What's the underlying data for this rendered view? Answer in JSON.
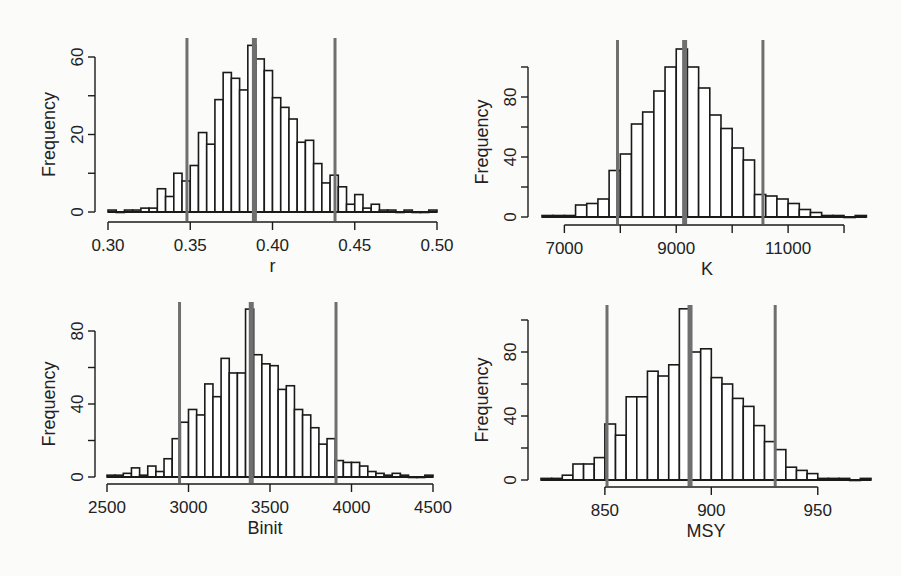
{
  "figure": {
    "background": "#fbfbfa",
    "bar_stroke": "#1a1a1a",
    "bar_fill": "#ffffff",
    "vline_color": "#6f6f6f",
    "axis_color": "#1a1a1a"
  },
  "chart_data": [
    {
      "id": "r",
      "type": "bar",
      "title": "",
      "xlabel": "r",
      "ylabel": "Frequency",
      "xlim": [
        0.3,
        0.5
      ],
      "ylim": [
        0,
        80
      ],
      "xticks": [
        0.3,
        0.35,
        0.4,
        0.45,
        0.5
      ],
      "xtick_labels": [
        "0.30",
        "0.35",
        "0.40",
        "0.45",
        "0.50"
      ],
      "yticks": [
        0,
        20,
        40,
        60,
        80
      ],
      "ytick_labels": [
        "0",
        "",
        "20",
        "",
        "60"
      ],
      "ytick_label_values": [
        0,
        20,
        60
      ],
      "bin_start": 0.3,
      "bin_width": 0.005,
      "values": [
        1,
        0,
        1,
        1,
        2,
        2,
        12,
        8,
        20,
        16,
        24,
        41,
        35,
        58,
        72,
        69,
        63,
        86,
        79,
        73,
        59,
        54,
        48,
        36,
        37,
        25,
        15,
        19,
        13,
        4,
        9,
        2,
        4,
        1,
        1,
        0,
        1,
        0,
        0,
        1
      ],
      "vlines": [
        {
          "x": 0.348,
          "role": "lower"
        },
        {
          "x": 0.389,
          "role": "median"
        },
        {
          "x": 0.438,
          "role": "upper"
        }
      ]
    },
    {
      "id": "K",
      "type": "bar",
      "title": "",
      "xlabel": "K",
      "ylabel": "Frequency",
      "xlim": [
        6600,
        12500
      ],
      "ylim": [
        0,
        100
      ],
      "xticks": [
        7000,
        8000,
        9000,
        10000,
        11000,
        12000
      ],
      "xtick_labels": [
        "7000",
        "",
        "9000",
        "",
        "11000",
        ""
      ],
      "yticks": [
        0,
        20,
        40,
        60,
        80,
        100
      ],
      "ytick_labels": [
        "0",
        "",
        "40",
        "",
        "80",
        ""
      ],
      "bin_start": 6600,
      "bin_width": 200,
      "values": [
        1,
        1,
        1,
        8,
        9,
        12,
        31,
        42,
        62,
        70,
        84,
        100,
        112,
        100,
        86,
        68,
        59,
        46,
        38,
        15,
        14,
        12,
        9,
        5,
        3,
        1,
        1,
        0,
        1
      ],
      "vlines": [
        {
          "x": 7950,
          "role": "lower"
        },
        {
          "x": 9150,
          "role": "median"
        },
        {
          "x": 10550,
          "role": "upper"
        }
      ]
    },
    {
      "id": "Binit",
      "type": "bar",
      "title": "",
      "xlabel": "Binit",
      "ylabel": "Frequency",
      "xlim": [
        2500,
        4500
      ],
      "ylim": [
        0,
        80
      ],
      "xticks": [
        2500,
        3000,
        3500,
        4000,
        4500
      ],
      "xtick_labels": [
        "2500",
        "3000",
        "3500",
        "4000",
        "4500"
      ],
      "yticks": [
        0,
        20,
        40,
        60,
        80
      ],
      "ytick_labels": [
        "0",
        "",
        "40",
        "",
        "80"
      ],
      "bin_start": 2500,
      "bin_width": 50,
      "values": [
        1,
        1,
        2,
        5,
        1,
        6,
        3,
        10,
        21,
        30,
        37,
        34,
        51,
        44,
        65,
        57,
        57,
        92,
        67,
        62,
        61,
        48,
        50,
        37,
        34,
        27,
        18,
        21,
        9,
        8,
        8,
        6,
        3,
        2,
        1,
        2,
        1,
        0,
        0,
        1
      ],
      "vlines": [
        {
          "x": 2945,
          "role": "lower"
        },
        {
          "x": 3385,
          "role": "median"
        },
        {
          "x": 3905,
          "role": "upper"
        }
      ]
    },
    {
      "id": "MSY",
      "type": "bar",
      "title": "",
      "xlabel": "MSY",
      "ylabel": "Frequency",
      "xlim": [
        820,
        975
      ],
      "ylim": [
        0,
        100
      ],
      "xticks": [
        850,
        900,
        950
      ],
      "xtick_labels": [
        "850",
        "900",
        "950"
      ],
      "yticks": [
        0,
        20,
        40,
        60,
        80,
        100
      ],
      "ytick_labels": [
        "0",
        "",
        "40",
        "",
        "80",
        ""
      ],
      "bin_start": 820,
      "bin_width": 5,
      "values": [
        1,
        1,
        3,
        10,
        10,
        14,
        35,
        28,
        52,
        52,
        68,
        65,
        72,
        107,
        80,
        82,
        64,
        60,
        51,
        46,
        34,
        24,
        19,
        8,
        6,
        4,
        1,
        1,
        1,
        0,
        1
      ],
      "vlines": [
        {
          "x": 851,
          "role": "lower"
        },
        {
          "x": 890,
          "role": "median"
        },
        {
          "x": 930,
          "role": "upper"
        }
      ]
    }
  ],
  "layout": [
    {
      "left": 0,
      "top": 0,
      "plot": {
        "x0": 108,
        "x1": 437,
        "yBase": 212,
        "yTop": 57,
        "xAxisY": 222,
        "yAxisX": 95,
        "vTop": 38
      }
    },
    {
      "left": 0,
      "top": 0,
      "plot": {
        "x0": 542,
        "x1": 872,
        "yBase": 217,
        "yTop": 67,
        "xAxisY": 225,
        "yAxisX": 528,
        "vTop": 40
      }
    },
    {
      "left": 0,
      "top": 0,
      "plot": {
        "x0": 107,
        "x1": 433,
        "yBase": 477,
        "yTop": 331,
        "xAxisY": 484,
        "yAxisX": 95,
        "vTop": 302
      }
    },
    {
      "left": 0,
      "top": 0,
      "plot": {
        "x0": 541,
        "x1": 871,
        "yBase": 480,
        "yTop": 320,
        "xAxisY": 487,
        "yAxisX": 528,
        "vTop": 305
      }
    }
  ]
}
